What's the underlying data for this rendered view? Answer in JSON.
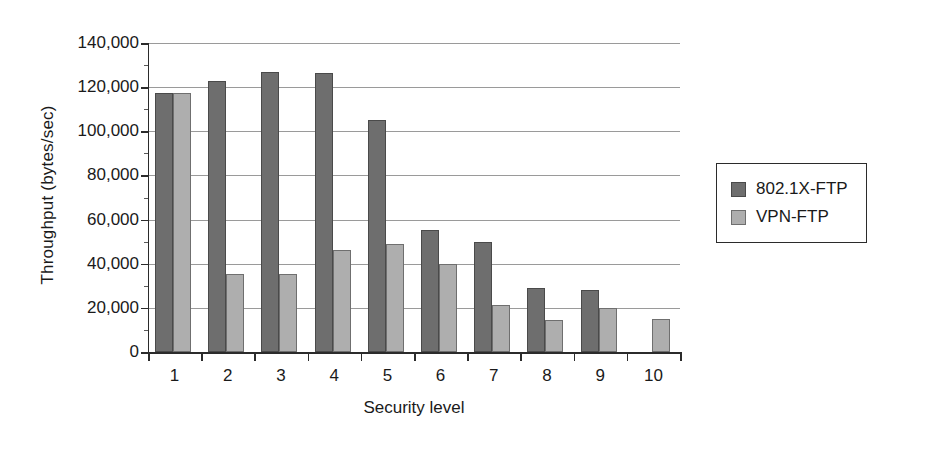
{
  "chart_data": {
    "type": "bar",
    "title": "",
    "xlabel": "Security level",
    "ylabel": "Throughput (bytes/sec)",
    "categories": [
      "1",
      "2",
      "3",
      "4",
      "5",
      "6",
      "7",
      "8",
      "9",
      "10"
    ],
    "series": [
      {
        "name": "802.1X-FTP",
        "color": "#6e6e6e",
        "values": [
          117500,
          123000,
          127000,
          126500,
          105000,
          55500,
          50000,
          29000,
          28000,
          null
        ]
      },
      {
        "name": "VPN-FTP",
        "color": "#aeaeae",
        "values": [
          117500,
          35500,
          35500,
          46000,
          49000,
          40000,
          21500,
          14500,
          20000,
          15000
        ]
      }
    ],
    "ylim": [
      0,
      140000
    ],
    "ytick_values": [
      0,
      20000,
      40000,
      60000,
      80000,
      100000,
      120000,
      140000
    ],
    "ytick_labels": [
      "0",
      "20,000",
      "40,000",
      "60,000",
      "80,000",
      "100,000",
      "120,000",
      "140,000"
    ],
    "grid": true,
    "legend_position": "right"
  },
  "legend": {
    "entries": [
      {
        "label": "802.1X-FTP"
      },
      {
        "label": "VPN-FTP"
      }
    ]
  }
}
